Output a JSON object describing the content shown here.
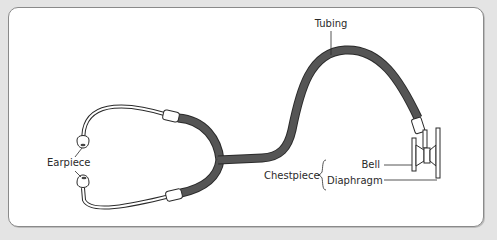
{
  "diagram": {
    "labels": {
      "tubing": "Tubing",
      "earpiece": "Earpiece",
      "chestpiece": "Chestpiece",
      "bell": "Bell",
      "diaphragm": "Diaphragm"
    },
    "colors": {
      "background": "#e4e4e4",
      "panel": "#ffffff",
      "panel_border": "#8a8a8a",
      "tubing_fill": "#555555",
      "outline": "#2a2a2a",
      "label_text": "#2a2a2a"
    }
  }
}
